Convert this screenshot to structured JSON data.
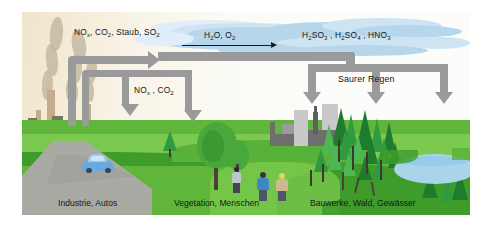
{
  "figure": {
    "topic": "Saurer Regen",
    "language": "de",
    "background_color": "#ffffff",
    "frame": {
      "x": 22,
      "y": 12,
      "width": 448,
      "height": 203
    }
  },
  "palette": {
    "sky_left": "#f0e4cc",
    "sky_right": "#fcfcfa",
    "cloud": "#b6d6ec",
    "grass": "#5fb63a",
    "grass_light": "#7cc94f",
    "grass_dark": "#3f9c2a",
    "pipe_arrow": "#9a9a9a",
    "road": "#a9aaa4",
    "smoke": "#c3b79f",
    "stack": "#c4ad8e",
    "building": "#c9c9c9",
    "building_dark": "#6e6e6e",
    "conifer": "#2f9b3e",
    "broadleaf": "#49a83c",
    "lake": "#a9d4ea",
    "car": "#6aa9dd",
    "text": "#131518"
  },
  "labels": {
    "emissions": {
      "text": "NOx, CO2, Staub, SO2",
      "parts": [
        "NO",
        "x",
        ", CO",
        "2",
        ", Staub, SO",
        "2"
      ],
      "html": "NO<sub>x</sub>, CO<sub>2</sub>, Staub, SO<sub>2</sub>"
    },
    "reactants": {
      "text": "H2O, O2",
      "html": "H<sub>2</sub>O, O<sub>2</sub>"
    },
    "acids": {
      "text": "H2SO3 , H2SO4 , HNO3",
      "html": "H<sub>2</sub>SO<sub>3</sub> , H<sub>2</sub>SO<sub>4</sub> , HNO<sub>3</sub>"
    },
    "secondary_emissions": {
      "text": "NOx , CO2",
      "html": "NO<sub>x</sub> , CO<sub>2</sub>"
    },
    "acid_rain": {
      "text": "Saurer Regen",
      "html": "Saurer Regen"
    }
  },
  "captions": [
    {
      "id": "source",
      "text": "Industrie, Autos"
    },
    {
      "id": "middle",
      "text": "Vegetation, Menschen"
    },
    {
      "id": "targets",
      "text": "Bauwerke, Wald, Gewässer"
    }
  ],
  "scene": {
    "left": {
      "name": "industry-zone",
      "elements": [
        "smokestacks",
        "smoke-plumes",
        "factory-skyline",
        "road",
        "car"
      ]
    },
    "center": {
      "name": "vegetation-zone",
      "elements": [
        "broadleaf-tree",
        "three-people",
        "meadow"
      ]
    },
    "right": {
      "name": "damage-zone",
      "elements": [
        "city-buildings",
        "church-spire",
        "conifer-forest",
        "lake",
        "dead-trees"
      ]
    }
  },
  "flow": {
    "direction": "left-to-right",
    "steps": [
      "emissions rise from industry and cars",
      "reaction with H2O and O2 in the atmosphere",
      "acids form",
      "acid rain falls on buildings, forest and waters"
    ]
  }
}
